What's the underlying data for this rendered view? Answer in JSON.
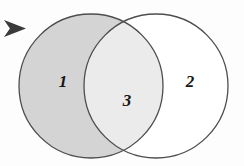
{
  "figure": {
    "type": "venn-diagram",
    "title": "",
    "background_color": "#fdfdfd",
    "regions": [
      {
        "id": "left-only",
        "label": "1",
        "fill_color": "#d4d4d4",
        "description": "left circle exclusive region, shaded medium gray",
        "label_x": 63,
        "label_y": 83
      },
      {
        "id": "intersection",
        "label": "3",
        "fill_color": "#ebebeb",
        "description": "overlap of both circles, shaded light gray",
        "label_x": 127,
        "label_y": 102
      },
      {
        "id": "right-only",
        "label": "2",
        "fill_color": "#ffffff",
        "description": "right circle exclusive region, unshaded white",
        "label_x": 190,
        "label_y": 83
      }
    ],
    "circles": [
      {
        "id": "left-circle",
        "cx": 91,
        "cy": 86,
        "r": 72,
        "stroke_color": "#4d4d4d",
        "stroke_width": 1.3,
        "fill_color": "#d4d4d4"
      },
      {
        "id": "right-circle",
        "cx": 156,
        "cy": 86,
        "r": 72,
        "stroke_color": "#4d4d4d",
        "stroke_width": 1.3,
        "fill_color": "#ffffff"
      }
    ],
    "cursor": {
      "name": "arrow-pointer",
      "color": "#3a3a3a",
      "x": 4,
      "y": 20,
      "width": 22,
      "height": 17
    }
  }
}
